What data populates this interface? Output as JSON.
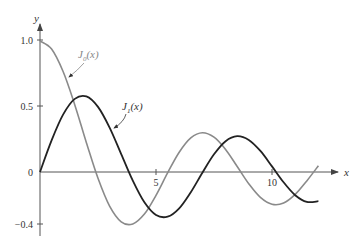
{
  "chart_data": {
    "type": "line",
    "title": "",
    "xlabel": "x",
    "ylabel": "y",
    "xlim": [
      0,
      12
    ],
    "ylim": [
      -0.45,
      1.05
    ],
    "grid": false,
    "x_ticks": [
      5,
      10
    ],
    "x_tick_labels": [
      "5",
      "10"
    ],
    "y_ticks": [
      1.0,
      0.5,
      0,
      -0.4
    ],
    "y_tick_labels": [
      "1.0",
      "0.5",
      "0",
      "−0.4"
    ],
    "x": [
      0,
      0.5,
      1,
      1.5,
      2,
      2.5,
      3,
      3.5,
      4,
      4.5,
      5,
      5.5,
      6,
      6.5,
      7,
      7.5,
      8,
      8.5,
      9,
      9.5,
      10,
      10.5,
      11,
      11.5,
      12
    ],
    "series": [
      {
        "name": "J0(x)",
        "label": "J",
        "label_sub": "0",
        "label_tail": "(x)",
        "color": "#8a8a8a",
        "values": [
          1.0,
          0.938,
          0.765,
          0.512,
          0.224,
          -0.048,
          -0.26,
          -0.38,
          -0.397,
          -0.321,
          -0.178,
          -0.007,
          0.151,
          0.26,
          0.3,
          0.266,
          0.172,
          0.042,
          -0.09,
          -0.194,
          -0.246,
          -0.237,
          -0.171,
          -0.068,
          0.048
        ]
      },
      {
        "name": "J1(x)",
        "label": "J",
        "label_sub": "1",
        "label_tail": "(x)",
        "color": "#222222",
        "values": [
          0.0,
          0.242,
          0.44,
          0.558,
          0.577,
          0.497,
          0.339,
          0.137,
          -0.066,
          -0.231,
          -0.328,
          -0.341,
          -0.277,
          -0.154,
          -0.005,
          0.135,
          0.235,
          0.273,
          0.245,
          0.161,
          0.043,
          -0.079,
          -0.177,
          -0.228,
          -0.223
        ]
      }
    ],
    "annotations": [
      {
        "text": "J0(x)",
        "points_to": "J0 curve"
      },
      {
        "text": "J1(x)",
        "points_to": "J1 curve"
      }
    ]
  }
}
